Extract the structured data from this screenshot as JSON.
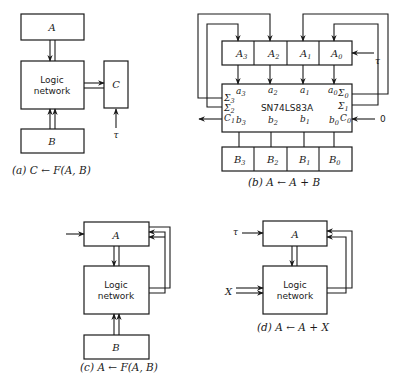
{
  "figure": {
    "panels": [
      {
        "id": "a",
        "caption": "(a) C ← F(A, B)",
        "registers": [
          "A",
          "B",
          "C"
        ],
        "logic_label": [
          "Logic",
          "network"
        ],
        "clock": "τ"
      },
      {
        "id": "b",
        "caption": "(b) A ← A + B",
        "register_a": [
          "A3",
          "A2",
          "A1",
          "A0"
        ],
        "register_b": [
          "B3",
          "B2",
          "B1",
          "B0"
        ],
        "chip": "SN74LS83A",
        "inputs_a": [
          "a3",
          "a2",
          "a1",
          "a0"
        ],
        "inputs_b": [
          "b3",
          "b2",
          "b1",
          "b0"
        ],
        "sums": [
          "Σ3",
          "Σ2",
          "Σ1",
          "Σ0"
        ],
        "carry_out": "C1",
        "carry_in": "C0",
        "carry_in_value": "0",
        "clock": "τ"
      },
      {
        "id": "c",
        "caption": "(c) A ← F(A, B)",
        "registers": [
          "A",
          "B"
        ],
        "logic_label": [
          "Logic",
          "network"
        ]
      },
      {
        "id": "d",
        "caption": "(d) A ← A + X",
        "registers": [
          "A"
        ],
        "input": "X",
        "logic_label": [
          "Logic",
          "network"
        ],
        "clock": "τ"
      }
    ]
  },
  "a": {
    "A": "A",
    "B": "B",
    "C": "C",
    "logic1": "Logic",
    "logic2": "network",
    "tau": "τ",
    "cap_pre": "(a) ",
    "cap": "C ← F(A, B)"
  },
  "b": {
    "A3": "A",
    "A2": "A",
    "A1": "A",
    "A0": "A",
    "s3": "3",
    "s2": "2",
    "s1": "1",
    "s0": "0",
    "chip": "SN74LS83A",
    "a": "a",
    "bb": "b",
    "sigma": "Σ",
    "C1": "C",
    "C0": "C",
    "zero": "0",
    "tau": "τ",
    "cap_pre": "(b) ",
    "cap": "A ← A + B"
  },
  "c": {
    "A": "A",
    "B": "B",
    "logic1": "Logic",
    "logic2": "network",
    "cap_pre": "(c) ",
    "cap": "A ← F(A, B)"
  },
  "d": {
    "A": "A",
    "X": "X",
    "tau": "τ",
    "logic1": "Logic",
    "logic2": "network",
    "cap_pre": "(d) ",
    "cap": "A ← A + X"
  }
}
